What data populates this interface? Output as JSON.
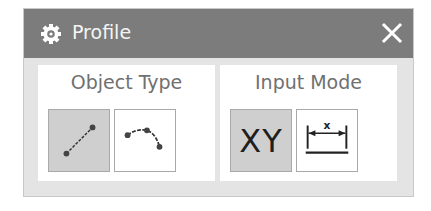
{
  "dialog": {
    "title": "Profile",
    "title_icon": "gear-icon",
    "close_icon": "close-icon",
    "colors": {
      "titlebar": "#7c7c7c",
      "title_text": "#f4f4f4",
      "body": "#e4e4e4",
      "group_bg": "#ffffff",
      "active_button": "#cfcfcf",
      "label_text": "#707070"
    }
  },
  "groups": [
    {
      "label": "Object Type",
      "buttons": [
        {
          "name": "line",
          "icon": "line-icon",
          "active": true
        },
        {
          "name": "arc",
          "icon": "arc-icon",
          "active": false
        }
      ]
    },
    {
      "label": "Input Mode",
      "buttons": [
        {
          "name": "coordinate-mode",
          "icon": "xy-icon",
          "text": "XY",
          "active": true
        },
        {
          "name": "parameter-mode",
          "icon": "parameter-icon",
          "text": "x",
          "active": false
        }
      ]
    }
  ]
}
